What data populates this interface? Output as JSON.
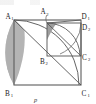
{
  "figure": {
    "caption": "p",
    "colors": {
      "stroke": "#5a5a5a",
      "stroke_dark": "#2e2e2e",
      "shade_outer": "#b0b0b0",
      "shade_inner": "#9a9a9a",
      "background": "#ffffff",
      "label": "#1a1a1a"
    },
    "outer_square": {
      "name": "A1B1C1D1",
      "corners": {
        "top_left": {
          "label": "A",
          "sub": "1",
          "x": 14,
          "y": 20
        },
        "bottom_left": {
          "label": "B",
          "sub": "1",
          "x": 14,
          "y": 85
        },
        "bottom_right": {
          "label": "C",
          "sub": "1",
          "x": 81,
          "y": 85
        },
        "top_right": {
          "label": "D",
          "sub": "1",
          "x": 81,
          "y": 20
        }
      }
    },
    "inner_square": {
      "name": "A2B2C2D2",
      "corners": {
        "top_left": {
          "label": "A",
          "sub": "2",
          "x": 47,
          "y": 23
        },
        "bottom_left": {
          "label": "B",
          "sub": "2",
          "x": 47,
          "y": 56
        },
        "bottom_right": {
          "label": "C",
          "sub": "2",
          "x": 81,
          "y": 56
        },
        "top_right": {
          "label": "D",
          "sub": "2",
          "x": 81,
          "y": 23
        }
      }
    },
    "labels": [
      {
        "id": "A1",
        "letter": "A",
        "subscript": "1",
        "tx": 8,
        "ty": 17
      },
      {
        "id": "A2",
        "letter": "A",
        "subscript": "2",
        "tx": 41,
        "ty": 14
      },
      {
        "id": "D1",
        "letter": "D",
        "subscript": "1",
        "tx": 84,
        "ty": 17
      },
      {
        "id": "D2",
        "letter": "D",
        "subscript": "2",
        "tx": 84,
        "ty": 28
      },
      {
        "id": "B2",
        "letter": "B",
        "subscript": "2",
        "tx": 40,
        "ty": 63
      },
      {
        "id": "B1",
        "letter": "B",
        "subscript": "1",
        "tx": 7,
        "ty": 95
      },
      {
        "id": "C2",
        "letter": "C",
        "subscript": "2",
        "tx": 84,
        "ty": 59
      },
      {
        "id": "C1",
        "letter": "C",
        "subscript": "1",
        "tx": 84,
        "ty": 95
      }
    ],
    "elements": {
      "diagonal": "A1 to C1",
      "arc_major": "quarter circle centered B1 from A1 to C1",
      "arc_inner_major": "quarter circle centered A1 from B1 to D1",
      "shaded_outer_wedge": "between left edge A1B1 and arc",
      "shaded_inner_wedge": "small wedge at A2 corner",
      "arc_small": "quarter circle centered B2 from A2 to C2",
      "leader_line": "curve from A2 label to inner square corner"
    }
  }
}
